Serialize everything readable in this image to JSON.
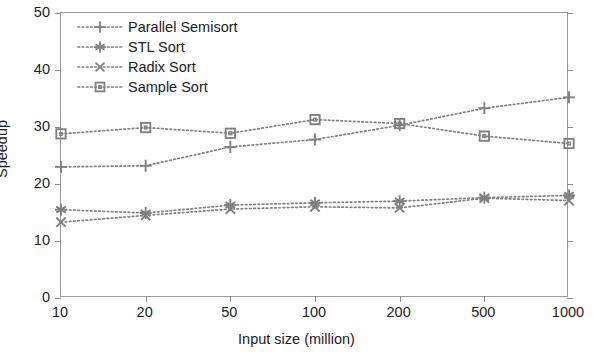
{
  "chart_data": {
    "type": "line",
    "title": "",
    "xlabel": "Input size (million)",
    "ylabel": "Speedup",
    "categories": [
      "10",
      "20",
      "50",
      "100",
      "200",
      "500",
      "1000"
    ],
    "xscale": "categorical",
    "ylim": [
      0,
      50
    ],
    "yticks": [
      0,
      10,
      20,
      30,
      40,
      50
    ],
    "grid": false,
    "legend_position": "upper left",
    "series": [
      {
        "name": "Parallel Semisort",
        "marker": "plus",
        "linestyle": "dotted",
        "color": "#808080",
        "values": [
          23.0,
          23.2,
          26.5,
          27.8,
          30.3,
          33.3,
          35.2
        ]
      },
      {
        "name": "STL Sort",
        "marker": "asterisk",
        "linestyle": "dotted",
        "color": "#808080",
        "values": [
          15.5,
          14.9,
          16.3,
          16.7,
          17.0,
          17.6,
          18.0
        ]
      },
      {
        "name": "Radix Sort",
        "marker": "cross",
        "linestyle": "dotted",
        "color": "#808080",
        "values": [
          13.3,
          14.5,
          15.6,
          16.0,
          15.8,
          17.5,
          17.1
        ]
      },
      {
        "name": "Sample Sort",
        "marker": "square",
        "linestyle": "dotted",
        "color": "#808080",
        "values": [
          28.8,
          29.9,
          28.9,
          31.3,
          30.6,
          28.4,
          27.1
        ]
      }
    ]
  },
  "axis": {
    "y_title": "Speedup",
    "x_title": "Input size (million)",
    "y_tick_labels": [
      "0",
      "10",
      "20",
      "30",
      "40",
      "50"
    ],
    "x_tick_labels": [
      "10",
      "20",
      "50",
      "100",
      "200",
      "500",
      "1000"
    ]
  },
  "legend": {
    "items": [
      {
        "label": "Parallel Semisort",
        "marker": "plus"
      },
      {
        "label": "STL Sort",
        "marker": "asterisk"
      },
      {
        "label": "Radix Sort",
        "marker": "cross"
      },
      {
        "label": "Sample Sort",
        "marker": "square"
      }
    ]
  },
  "style": {
    "series_color": "#808080",
    "axis_color": "#9a9a9a",
    "text_color": "#1c1c1c",
    "background": "#ffffff"
  }
}
